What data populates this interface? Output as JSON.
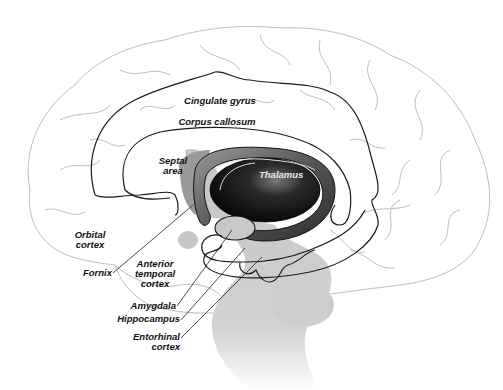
{
  "diagram": {
    "colors": {
      "background": "#ffffff",
      "brain_outline": "#bdbdbd",
      "limbic_outline": "#1a1a1a",
      "brainstem_shadow": "#c8c8c8",
      "thalamus_dark": "#111111",
      "fornix_ring": "#4a4a4a",
      "label_text": "#111111"
    },
    "labels": {
      "cingulate_gyrus": "Cingulate gyrus",
      "corpus_callosum": "Corpus callosum",
      "septal_area": "Septal\narea",
      "thalamus": "Thalamus",
      "orbital_cortex": "Orbital\ncortex",
      "fornix": "Fornix",
      "anterior_temporal_cortex": "Anterior\ntemporal\ncortex",
      "amygdala": "Amygdala",
      "hippocampus": "Hippocampus",
      "entorhinal_cortex": "Entorhinal\ncortex"
    }
  }
}
